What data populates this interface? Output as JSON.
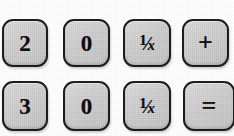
{
  "image": {
    "kind": "calculator-keypad-fragment",
    "background_color": "#fefefe",
    "width": 234,
    "height": 136
  },
  "palette": {
    "key_face": "#d6d6d6",
    "key_border": "#1d1d1d",
    "glyph_color": "#101010",
    "paper": "#ffffff"
  },
  "keypad": {
    "rows": [
      {
        "name": "top-row",
        "keys": [
          {
            "id": "key-2",
            "label": "2",
            "icon": "digit-two-glyph",
            "type": "digit"
          },
          {
            "id": "key-0-top",
            "label": "0",
            "icon": "digit-zero-glyph",
            "type": "digit"
          },
          {
            "id": "key-recip-1",
            "label": "1/x",
            "icon": "reciprocal-icon",
            "type": "function",
            "fraction": {
              "numerator": "1",
              "bar": "⁄",
              "denominator": "x"
            }
          },
          {
            "id": "key-plus",
            "label": "+",
            "icon": "plus-icon",
            "type": "operator"
          }
        ]
      },
      {
        "name": "bottom-row",
        "keys": [
          {
            "id": "key-3",
            "label": "3",
            "icon": "digit-three-glyph",
            "type": "digit"
          },
          {
            "id": "key-0-bottom",
            "label": "0",
            "icon": "digit-zero-glyph",
            "type": "digit"
          },
          {
            "id": "key-recip-2",
            "label": "1/x",
            "icon": "reciprocal-icon",
            "type": "function",
            "fraction": {
              "numerator": "1",
              "bar": "⁄",
              "denominator": "x"
            }
          },
          {
            "id": "key-equals",
            "label": "=",
            "icon": "equals-icon",
            "type": "operator",
            "clipped": "right-edge"
          }
        ]
      }
    ]
  }
}
